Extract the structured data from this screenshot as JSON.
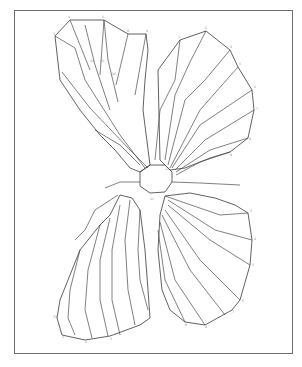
{
  "figure": {
    "title": "",
    "frame": {
      "x": 14,
      "y": 10,
      "w": 279,
      "h": 344,
      "color": "#6e6e6e"
    },
    "stroke_color": "#3a3a3a",
    "label_color": "#8a8a8a"
  },
  "outlines": {
    "upper_left_wing": "M55,36 L70,20 L104,20 L128,34 L146,34 L148,50 L145,80 L143,110 L150,165 L140,172 L130,168 L115,150 L100,135 L80,110 L60,80 Z",
    "upper_right_wing": "M158,70 L180,40 L206,31 L230,50 L238,67 L252,90 L254,110 L248,138 L230,152 L210,158 L185,168 L170,170 L160,160 Z",
    "lower_left_wing": "M120,195 L110,215 L100,225 L80,250 L72,270 L60,300 L57,318 L62,335 L85,340 L110,336 L140,325 L150,318 L148,290 L145,250 L140,210 L132,198 Z",
    "lower_right_wing": "M165,196 L190,193 L215,198 L235,205 L248,213 L252,240 L250,265 L240,300 L232,310 L205,325 L185,322 L170,310 L162,290 L158,250 L160,215 Z",
    "body": "M140,172 L150,165 L165,165 L172,172 L172,182 L165,192 L150,193 L140,186 Z"
  },
  "veins": [
    "M70,20 L90,70",
    "M104,20 L100,75",
    "M128,34 L116,85",
    "M146,34 L135,95",
    "M104,20 L108,60 L118,102",
    "M85,25 L95,65 L110,110",
    "M55,36 L75,48 L85,80 L120,135 L145,168",
    "M62,72 L90,108 L130,150 L148,168",
    "M95,130 L120,145 L140,165",
    "M180,40 L175,80 L160,110 L155,160",
    "M206,31 L190,62 L175,95 L165,160",
    "M230,50 L205,80 L185,100 L168,165",
    "M238,67 L200,110 L170,168",
    "M252,90 L200,125 L172,168",
    "M254,110 L205,140 L175,170",
    "M248,138 L210,150 L176,172",
    "M230,152 L200,162 L176,175",
    "M140,210 L138,250 L140,280 L148,310",
    "M130,200 L125,240 L128,290 L135,325",
    "M120,205 L112,250 L112,300 L120,335",
    "M110,218 L100,260 L100,300 L108,336",
    "M100,225 L88,270 L85,310 L92,338",
    "M80,250 L70,290 L68,318 L75,335",
    "M118,195 L95,210 L85,230 L75,240",
    "M165,196 L220,215 L248,213",
    "M168,200 L215,230 L252,240",
    "M168,205 L210,240 L250,265",
    "M165,210 L200,260 L240,300",
    "M162,215 L190,270 L225,315",
    "M160,222 L175,280 L205,325",
    "M158,230 L165,280 L185,322",
    "M172,182 L200,183 L240,185",
    "M140,182 L120,182 L105,188"
  ],
  "labels": [
    {
      "x": 68,
      "y": 18,
      "t": "4"
    },
    {
      "x": 102,
      "y": 18,
      "t": "6"
    },
    {
      "x": 127,
      "y": 32,
      "t": "8"
    },
    {
      "x": 146,
      "y": 32,
      "t": "9"
    },
    {
      "x": 53,
      "y": 35,
      "t": "3"
    },
    {
      "x": 90,
      "y": 62,
      "t": "24"
    },
    {
      "x": 100,
      "y": 62,
      "t": "25"
    },
    {
      "x": 112,
      "y": 75,
      "t": "26"
    },
    {
      "x": 178,
      "y": 38,
      "t": "1"
    },
    {
      "x": 205,
      "y": 29,
      "t": "2"
    },
    {
      "x": 230,
      "y": 48,
      "t": "4"
    },
    {
      "x": 239,
      "y": 65,
      "t": "5"
    },
    {
      "x": 254,
      "y": 88,
      "t": "6"
    },
    {
      "x": 256,
      "y": 110,
      "t": "7"
    },
    {
      "x": 249,
      "y": 140,
      "t": "8"
    },
    {
      "x": 230,
      "y": 156,
      "t": "9"
    },
    {
      "x": 250,
      "y": 212,
      "t": "3"
    },
    {
      "x": 254,
      "y": 240,
      "t": "4"
    },
    {
      "x": 252,
      "y": 266,
      "t": "5"
    },
    {
      "x": 242,
      "y": 302,
      "t": "6"
    },
    {
      "x": 232,
      "y": 313,
      "t": "7"
    },
    {
      "x": 205,
      "y": 328,
      "t": "8"
    },
    {
      "x": 185,
      "y": 326,
      "t": "9"
    },
    {
      "x": 110,
      "y": 340,
      "t": "3"
    },
    {
      "x": 85,
      "y": 343,
      "t": "2"
    },
    {
      "x": 62,
      "y": 338,
      "t": "1"
    },
    {
      "x": 53,
      "y": 318,
      "t": "33"
    },
    {
      "x": 150,
      "y": 200,
      "t": "11"
    },
    {
      "x": 165,
      "y": 170,
      "t": "12"
    }
  ]
}
